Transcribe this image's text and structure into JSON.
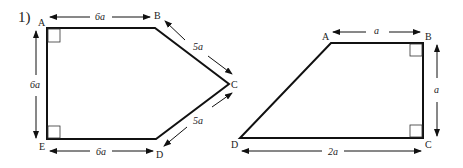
{
  "problem_number": "1)",
  "figure_left": {
    "shape": "pentagon",
    "vertices": [
      "A",
      "B",
      "C",
      "D",
      "E"
    ],
    "dimensions": {
      "AB": "6a",
      "BC": "5a",
      "CD": "5a",
      "DE": "6a",
      "EA": "6a"
    },
    "right_angles": [
      "A",
      "E"
    ]
  },
  "figure_right": {
    "shape": "right trapezoid",
    "vertices": [
      "A",
      "B",
      "C",
      "D"
    ],
    "dimensions": {
      "AB": "a",
      "BC": "a",
      "DC": "2a"
    },
    "right_angles": [
      "B",
      "C"
    ]
  }
}
